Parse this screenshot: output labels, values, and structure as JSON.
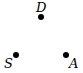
{
  "diagram": {
    "nodes": [
      {
        "id": "D",
        "label": "D",
        "x": 41,
        "y": 17,
        "label_x": 36,
        "label_y": 1
      },
      {
        "id": "S",
        "label": "S",
        "x": 16,
        "y": 55,
        "label_x": 4,
        "label_y": 57
      },
      {
        "id": "A",
        "label": "A",
        "x": 66,
        "y": 55,
        "label_x": 69,
        "label_y": 57
      }
    ],
    "dot_color": "#000000"
  }
}
